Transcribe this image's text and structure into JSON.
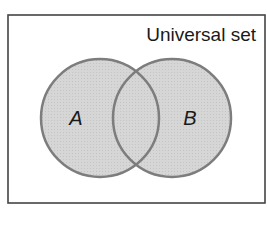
{
  "diagram": {
    "type": "venn",
    "universal_label": "Universal set",
    "sets": [
      {
        "label": "A",
        "cx": 100,
        "cy": 118,
        "r": 59
      },
      {
        "label": "B",
        "cx": 172,
        "cy": 118,
        "r": 59
      }
    ],
    "colors": {
      "fill": "#d4d4d4",
      "stroke": "#7d7d7d",
      "border": "#444444",
      "text": "#1a1a1a"
    }
  }
}
